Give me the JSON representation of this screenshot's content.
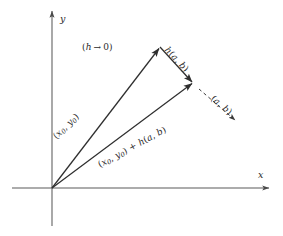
{
  "figure": {
    "background_color": "#ffffff",
    "stroke_color": "#2f2f2f",
    "axes": {
      "x_label": "x",
      "y_label": "y",
      "origin": [
        52,
        188
      ],
      "x_axis_from": [
        12,
        188
      ],
      "x_axis_to": [
        272,
        188
      ],
      "y_axis_from": [
        52,
        226
      ],
      "y_axis_to": [
        52,
        8
      ]
    },
    "vectors": [
      {
        "name": "base-vector",
        "label": "(x₀, y₀)",
        "from": [
          52,
          188
        ],
        "to": [
          160,
          47
        ],
        "style": "solid",
        "arrow": true
      },
      {
        "name": "increment-vector",
        "label": "h(a, b)",
        "from": [
          160,
          47
        ],
        "to": [
          193,
          83
        ],
        "style": "solid",
        "arrow": true
      },
      {
        "name": "sum-vector",
        "label": "(x₀, y₀) + h(a, b)",
        "from": [
          52,
          188
        ],
        "to": [
          193,
          83
        ],
        "style": "solid",
        "arrow": true
      },
      {
        "name": "direction-vector",
        "label": "(a, b)",
        "from": [
          198,
          88
        ],
        "to": [
          237,
          122
        ],
        "style": "dashed",
        "arrow": true
      }
    ],
    "annotations": [
      {
        "name": "limit-note",
        "text": "(h → 0)",
        "position": [
          82,
          48
        ]
      }
    ]
  },
  "labels": {
    "limit_note_open": "(",
    "limit_note_h": "h",
    "limit_note_arrow": "→",
    "limit_note_zero": "0",
    "limit_note_close": ")",
    "base_open": "(",
    "base_x": "x",
    "base_x_sub": "0",
    "base_comma": ", ",
    "base_y": "y",
    "base_y_sub": "0",
    "base_close": ")",
    "h_func": "h",
    "h_open": "(",
    "h_a": "a",
    "h_comma": ", ",
    "h_b": "b",
    "h_close": ")",
    "dir_open": "(",
    "dir_a": "a",
    "dir_comma": ", ",
    "dir_b": "b",
    "dir_close": ")",
    "sum_plus": " + ",
    "axis_x": "x",
    "axis_y": "y"
  }
}
